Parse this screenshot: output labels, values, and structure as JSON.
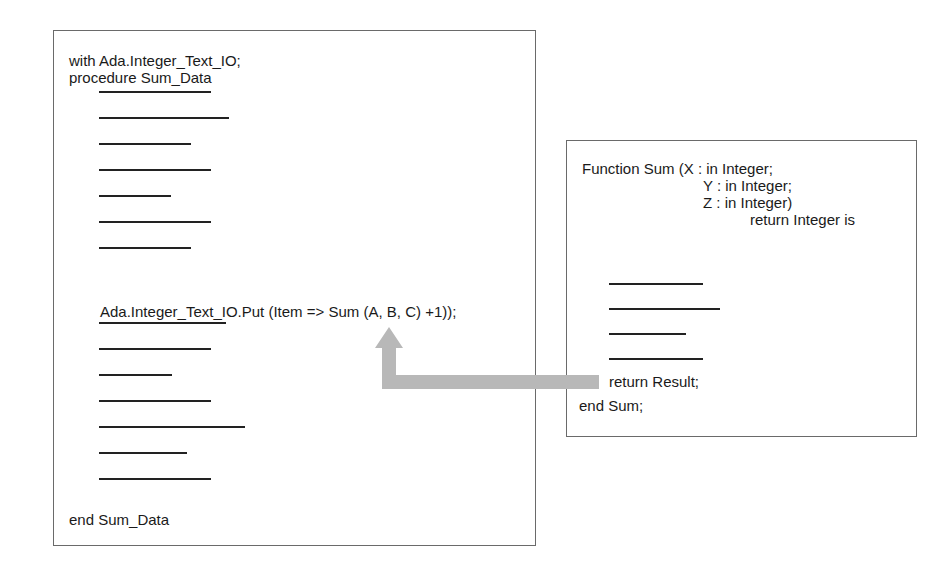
{
  "main_procedure": {
    "header_lines": [
      "with Ada.Integer_Text_IO;",
      "procedure Sum_Data"
    ],
    "placeholders_before": [
      {
        "top": 91,
        "width": 112
      },
      {
        "top": 117,
        "width": 130
      },
      {
        "top": 143,
        "width": 92
      },
      {
        "top": 169,
        "width": 112
      },
      {
        "top": 195,
        "width": 72
      },
      {
        "top": 221,
        "width": 112
      },
      {
        "top": 247,
        "width": 92
      }
    ],
    "call_statement": "Ada.Integer_Text_IO.Put (Item => Sum (A, B, C) +1));",
    "placeholders_after": [
      {
        "top": 322,
        "width": 127
      },
      {
        "top": 348,
        "width": 112
      },
      {
        "top": 374,
        "width": 73
      },
      {
        "top": 400,
        "width": 112
      },
      {
        "top": 426,
        "width": 146
      },
      {
        "top": 452,
        "width": 88
      },
      {
        "top": 478,
        "width": 112
      }
    ],
    "footer": "end Sum_Data"
  },
  "function_sum": {
    "signature_lines": [
      "Function Sum (X : in Integer;",
      "Y : in Integer;",
      "Z : in Integer)",
      "return Integer is"
    ],
    "placeholders": [
      {
        "top": 283,
        "width": 94
      },
      {
        "top": 308,
        "width": 111
      },
      {
        "top": 333,
        "width": 77
      },
      {
        "top": 358,
        "width": 94
      }
    ],
    "return_statement": "return Result;",
    "footer": "end Sum;"
  },
  "arrow": {
    "label": "function-call-return-flow",
    "color": "#b8b8b8"
  }
}
